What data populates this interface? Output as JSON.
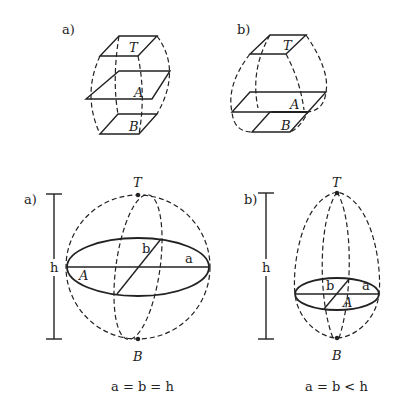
{
  "panels": {
    "top_a": {
      "label": "a)",
      "planes": {
        "top": "T",
        "middle": "A",
        "bottom": "B"
      }
    },
    "top_b": {
      "label": "b)",
      "planes": {
        "top": "T",
        "middle": "A",
        "bottom": "B"
      }
    },
    "bottom_a": {
      "label": "a)",
      "pole_top": "T",
      "pole_bottom": "B",
      "plane": "A",
      "axis_a": "a",
      "axis_b": "b",
      "height": "h",
      "caption": "a = b = h"
    },
    "bottom_b": {
      "label": "b)",
      "pole_top": "T",
      "pole_bottom": "B",
      "plane": "A",
      "axis_a": "a",
      "axis_b": "b",
      "height": "h",
      "caption": "a = b < h"
    }
  },
  "colors": {
    "ink": "#222222",
    "background": "#ffffff"
  }
}
